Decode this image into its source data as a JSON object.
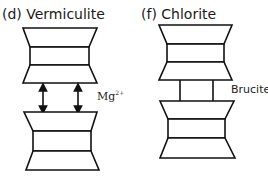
{
  "panels": [
    {
      "id": "d",
      "title": "(d) Vermiculite",
      "interlayer_label": "Mg",
      "interlayer_superscript": "2+",
      "interlayer_type": "arrows"
    },
    {
      "id": "f",
      "title": "(f) Chlorite",
      "interlayer_label": "Brucite",
      "interlayer_type": "brucite-sheet"
    }
  ]
}
